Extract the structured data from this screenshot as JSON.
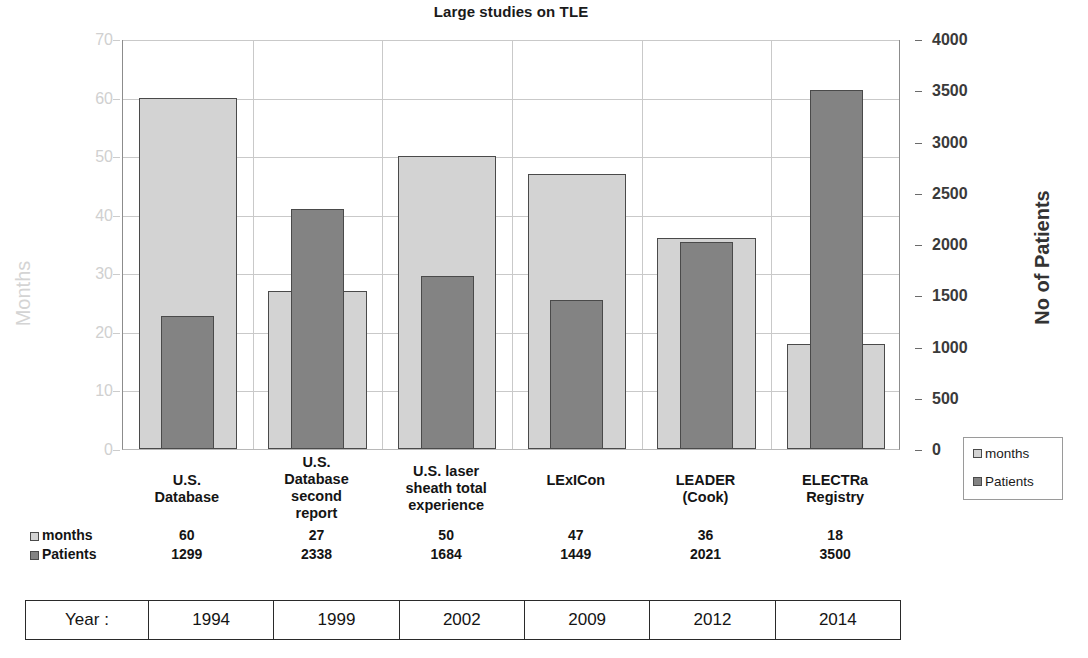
{
  "chart_data": {
    "type": "bar",
    "title": "Large studies on TLE",
    "categories": [
      "U.S. Database",
      "U.S. Database second report",
      "U.S. laser sheath total experience",
      "LExICon",
      "LEADER (Cook)",
      "ELECTRa Registry"
    ],
    "category_lines": [
      [
        "U.S.",
        "Database"
      ],
      [
        "U.S.",
        "Database",
        "second",
        "report"
      ],
      [
        "U.S. laser",
        "sheath total",
        "experience"
      ],
      [
        "LExICon"
      ],
      [
        "LEADER",
        "(Cook)"
      ],
      [
        "ELECTRa",
        "Registry"
      ]
    ],
    "series": [
      {
        "name": "months",
        "axis": "left",
        "values": [
          60,
          27,
          50,
          47,
          36,
          18
        ],
        "color": "#d3d3d3"
      },
      {
        "name": "Patients",
        "axis": "right",
        "values": [
          1299,
          2338,
          1684,
          1449,
          2021,
          3500
        ],
        "color": "#838383"
      }
    ],
    "years": [
      "1994",
      "1999",
      "2002",
      "2009",
      "2012",
      "2014"
    ],
    "ylabel_left": "Months",
    "ylabel_right": "No of Patients",
    "ylim_left": [
      0,
      70
    ],
    "ylim_right": [
      0,
      4000
    ],
    "yticks_left": [
      0,
      10,
      20,
      30,
      40,
      50,
      60,
      70
    ],
    "yticks_right": [
      0,
      500,
      1000,
      1500,
      2000,
      2500,
      3000,
      3500,
      4000
    ],
    "xlabel": "",
    "grid": true,
    "legend_position": "right"
  },
  "legend": {
    "items": [
      {
        "label": "months",
        "color": "#d3d3d3"
      },
      {
        "label": "Patients",
        "color": "#838383"
      }
    ]
  },
  "data_table": {
    "rows": [
      {
        "key": "months",
        "values": [
          "60",
          "27",
          "50",
          "47",
          "36",
          "18"
        ]
      },
      {
        "key": "Patients",
        "values": [
          "1299",
          "2338",
          "1684",
          "1449",
          "2021",
          "3500"
        ]
      }
    ]
  },
  "year_table": {
    "header": "Year :",
    "values": [
      "1994",
      "1999",
      "2002",
      "2009",
      "2012",
      "2014"
    ]
  }
}
